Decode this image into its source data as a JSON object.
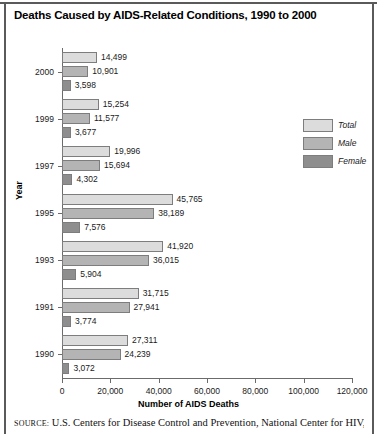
{
  "title": "Deaths Caused by AIDS-Related Conditions, 1990 to 2000",
  "source": {
    "label": "SOURCE:",
    "text": "U.S. Centers for Disease Control and Prevention, National Center for HIV,"
  },
  "legend": {
    "items": [
      {
        "key": "total",
        "label": "Total",
        "color": "#dcdcdc"
      },
      {
        "key": "male",
        "label": "Male",
        "color": "#b4b4b4"
      },
      {
        "key": "female",
        "label": "Female",
        "color": "#8e8e8e"
      }
    ]
  },
  "chart_data": {
    "type": "bar",
    "orientation": "horizontal",
    "title": "Deaths Caused by AIDS-Related Conditions, 1990 to 2000",
    "xlabel": "Number of AIDS Deaths",
    "ylabel": "Year",
    "xlim": [
      0,
      120000
    ],
    "xticks": [
      0,
      20000,
      40000,
      60000,
      80000,
      100000,
      120000
    ],
    "xtick_labels": [
      "0",
      "20,000",
      "40,000",
      "60,000",
      "80,000",
      "100,000",
      "120,000"
    ],
    "grid": false,
    "legend_position": "right",
    "categories": [
      "2000",
      "1999",
      "1997",
      "1995",
      "1993",
      "1991",
      "1990"
    ],
    "series": [
      {
        "name": "Total",
        "color": "#dcdcdc",
        "values": [
          14499,
          15254,
          19996,
          45765,
          41920,
          31715,
          27311
        ],
        "labels": [
          "14,499",
          "15,254",
          "19,996",
          "45,765",
          "41,920",
          "31,715",
          "27,311"
        ]
      },
      {
        "name": "Male",
        "color": "#b4b4b4",
        "values": [
          10901,
          11577,
          15694,
          38189,
          36015,
          27941,
          24239
        ],
        "labels": [
          "10,901",
          "11,577",
          "15,694",
          "38,189",
          "36,015",
          "27,941",
          "24,239"
        ]
      },
      {
        "name": "Female",
        "color": "#8e8e8e",
        "values": [
          3598,
          3677,
          4302,
          7576,
          5904,
          3774,
          3072
        ],
        "labels": [
          "3,598",
          "3,677",
          "4,302",
          "7,576",
          "5,904",
          "3,774",
          "3,072"
        ]
      }
    ]
  }
}
